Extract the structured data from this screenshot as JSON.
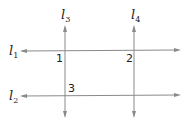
{
  "lines": {
    "l1": {
      "name": "l",
      "sub": "1"
    },
    "l2": {
      "name": "l",
      "sub": "2"
    },
    "l3": {
      "name": "l",
      "sub": "3"
    },
    "l4": {
      "name": "l",
      "sub": "4"
    }
  },
  "angles": {
    "a1": "1",
    "a2": "2",
    "a3": "3"
  },
  "colors": {
    "line": "#8a8a8a",
    "text": "#222222"
  }
}
